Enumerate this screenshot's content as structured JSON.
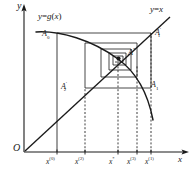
{
  "figure": {
    "type": "mathematical-diagram",
    "background_color": "#ffffff",
    "ink_color": "#1a1a1a",
    "axes": {
      "origin_label": "O",
      "x_axis_label": "x",
      "y_axis_label": "y",
      "origin_px": [
        24,
        152
      ],
      "x_axis_end_px": [
        188,
        152
      ],
      "y_axis_top_px": [
        24,
        6
      ]
    },
    "curves": [
      {
        "name": "g-curve",
        "label": "y=g(x)",
        "label_parts": {
          "y": "y",
          "eq": "=",
          "g": "g",
          "open": "(",
          "x": "x",
          "close": ")"
        },
        "style": "solid",
        "label_pos_px": [
          38,
          14
        ]
      },
      {
        "name": "identity-line",
        "label": "y=x",
        "label_parts": {
          "y": "y",
          "eq": "=",
          "x": "x"
        },
        "style": "solid",
        "label_pos_px": [
          150,
          7
        ]
      }
    ],
    "points": [
      {
        "name": "A0",
        "label_main": "A",
        "label_sub": "0",
        "label_prime": "",
        "pos_px": [
          46,
          32
        ]
      },
      {
        "name": "A1p",
        "label_main": "A",
        "label_sub": "1",
        "label_prime": "'",
        "pos_px": [
          156,
          29
        ]
      },
      {
        "name": "Astar",
        "label_main": "A",
        "label_sub": "",
        "label_prime": "*",
        "pos_px": [
          129,
          49
        ]
      },
      {
        "name": "A2p",
        "label_main": "A",
        "label_sub": "2",
        "label_prime": "'",
        "pos_px": [
          62,
          83
        ]
      },
      {
        "name": "A1",
        "label_main": "A",
        "label_sub": "1",
        "label_prime": "",
        "pos_px": [
          151,
          82
        ]
      }
    ],
    "x_ticks": [
      {
        "name": "x0",
        "base": "x",
        "sup": "(0)",
        "pos_px": [
          47,
          157
        ],
        "tick_x_px": 57,
        "line": "solid"
      },
      {
        "name": "x2",
        "base": "x",
        "sup": "(2)",
        "pos_px": [
          76,
          157
        ],
        "tick_x_px": 85,
        "line": "dashed"
      },
      {
        "name": "xstar",
        "base": "x",
        "sup": "*",
        "pos_px": [
          109,
          157
        ],
        "tick_x_px": 118,
        "line": "dashed"
      },
      {
        "name": "x3",
        "base": "x",
        "sup": "(3)",
        "pos_px": [
          128,
          157
        ],
        "tick_x_px": 137,
        "line": "dashed"
      },
      {
        "name": "x1",
        "base": "x",
        "sup": "(1)",
        "pos_px": [
          146,
          157
        ],
        "tick_x_px": 151,
        "line": "dashed"
      }
    ]
  }
}
